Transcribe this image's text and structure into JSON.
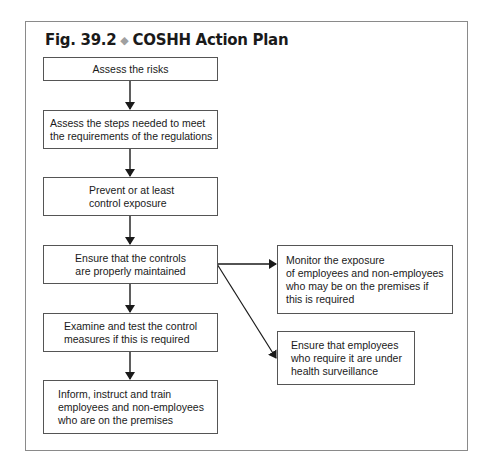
{
  "figure": {
    "label": "Fig. 39.2",
    "separator": "◆",
    "title": "COSHH Action Plan"
  },
  "steps": [
    {
      "text": "Assess the risks"
    },
    {
      "text": "Assess the steps needed to meet\nthe requirements of the regulations"
    },
    {
      "text": "Prevent or at least\ncontrol exposure"
    },
    {
      "text": "Ensure that the controls\nare properly maintained"
    },
    {
      "text": "Examine and test the control\nmeasures if this is required"
    },
    {
      "text": "Inform, instruct and train\nemployees and non-employees\nwho are on the premises"
    }
  ],
  "branches": [
    {
      "text": "Monitor the exposure\nof employees and non-employees\nwho may be on the premises if\nthis is required"
    },
    {
      "text": "Ensure that employees\nwho require it are under\nhealth surveillance"
    }
  ],
  "colors": {
    "line": "#1a1a1a",
    "border": "#555555",
    "frame": "#8a8a8a",
    "diamond": "#a0a0a0"
  }
}
